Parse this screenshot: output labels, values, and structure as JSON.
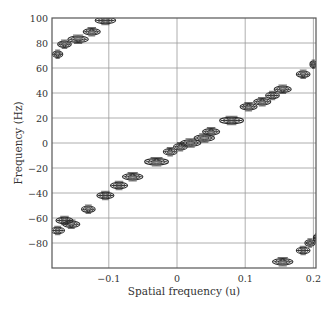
{
  "chart_data": {
    "type": "scatter",
    "title": "",
    "xlabel": "Spatial frequency (u)",
    "ylabel": "Frequency (Hz)",
    "xlim": [
      -0.18,
      0.2
    ],
    "ylim": [
      -100,
      100
    ],
    "xticks": [
      -0.1,
      0,
      0.1,
      0.2
    ],
    "xtick_labels": [
      "−0.1",
      "0",
      "0.1",
      "0.2"
    ],
    "yticks": [
      100,
      80,
      60,
      40,
      20,
      0,
      -20,
      -40,
      -60,
      -80
    ],
    "ytick_labels": [
      "100",
      "80",
      "60",
      "40",
      "20",
      "0",
      "−20",
      "−40",
      "−60",
      "−80"
    ],
    "grid": true,
    "legend": null,
    "marker_style": "contour blobs (elongated horizontal)",
    "series": [
      {
        "name": "main ridge",
        "points": [
          {
            "u": -0.175,
            "f": -70,
            "w": 0.02
          },
          {
            "u": -0.165,
            "f": -62,
            "w": 0.025
          },
          {
            "u": -0.155,
            "f": -65,
            "w": 0.025
          },
          {
            "u": -0.13,
            "f": -53,
            "w": 0.02
          },
          {
            "u": -0.105,
            "f": -42,
            "w": 0.025
          },
          {
            "u": -0.085,
            "f": -34,
            "w": 0.025
          },
          {
            "u": -0.065,
            "f": -27,
            "w": 0.03
          },
          {
            "u": -0.03,
            "f": -15,
            "w": 0.035
          },
          {
            "u": -0.01,
            "f": -7,
            "w": 0.02
          },
          {
            "u": 0.005,
            "f": -3,
            "w": 0.02
          },
          {
            "u": 0.02,
            "f": 0,
            "w": 0.03
          },
          {
            "u": 0.04,
            "f": 4,
            "w": 0.03
          },
          {
            "u": 0.05,
            "f": 9,
            "w": 0.025
          },
          {
            "u": 0.08,
            "f": 18,
            "w": 0.035
          },
          {
            "u": 0.105,
            "f": 29,
            "w": 0.025
          },
          {
            "u": 0.125,
            "f": 33,
            "w": 0.025
          },
          {
            "u": 0.14,
            "f": 38,
            "w": 0.02
          },
          {
            "u": 0.155,
            "f": 43,
            "w": 0.025
          },
          {
            "u": 0.185,
            "f": 55,
            "w": 0.02
          },
          {
            "u": 0.2,
            "f": 63,
            "w": 0.01
          }
        ]
      },
      {
        "name": "aliased ridge (top-left)",
        "points": [
          {
            "u": -0.175,
            "f": 71,
            "w": 0.015
          },
          {
            "u": -0.165,
            "f": 79,
            "w": 0.02
          },
          {
            "u": -0.145,
            "f": 83,
            "w": 0.03
          },
          {
            "u": -0.125,
            "f": 89,
            "w": 0.025
          },
          {
            "u": -0.105,
            "f": 98,
            "w": 0.03
          }
        ]
      },
      {
        "name": "aliased ridge (bottom-right)",
        "points": [
          {
            "u": 0.155,
            "f": -95,
            "w": 0.03
          },
          {
            "u": 0.185,
            "f": -86,
            "w": 0.02
          },
          {
            "u": 0.195,
            "f": -80,
            "w": 0.015
          },
          {
            "u": 0.205,
            "f": -76,
            "w": 0.01
          }
        ]
      }
    ]
  },
  "colors": {
    "axis": "#555555",
    "grid": "#9a9a9a",
    "blob": "#2a2a2a",
    "background": "#ffffff"
  }
}
